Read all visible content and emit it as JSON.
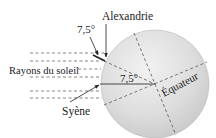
{
  "diagram": {
    "labels": {
      "alexandrie": "Alexandrie",
      "syene": "Syène",
      "rays": "Rayons du soleil",
      "angle_top": "7,5°",
      "angle_center": "7,5°",
      "equator": "Équateur"
    },
    "colors": {
      "earth_fill": "#d9d9d9",
      "line": "#333333",
      "dash": "#555555"
    }
  }
}
